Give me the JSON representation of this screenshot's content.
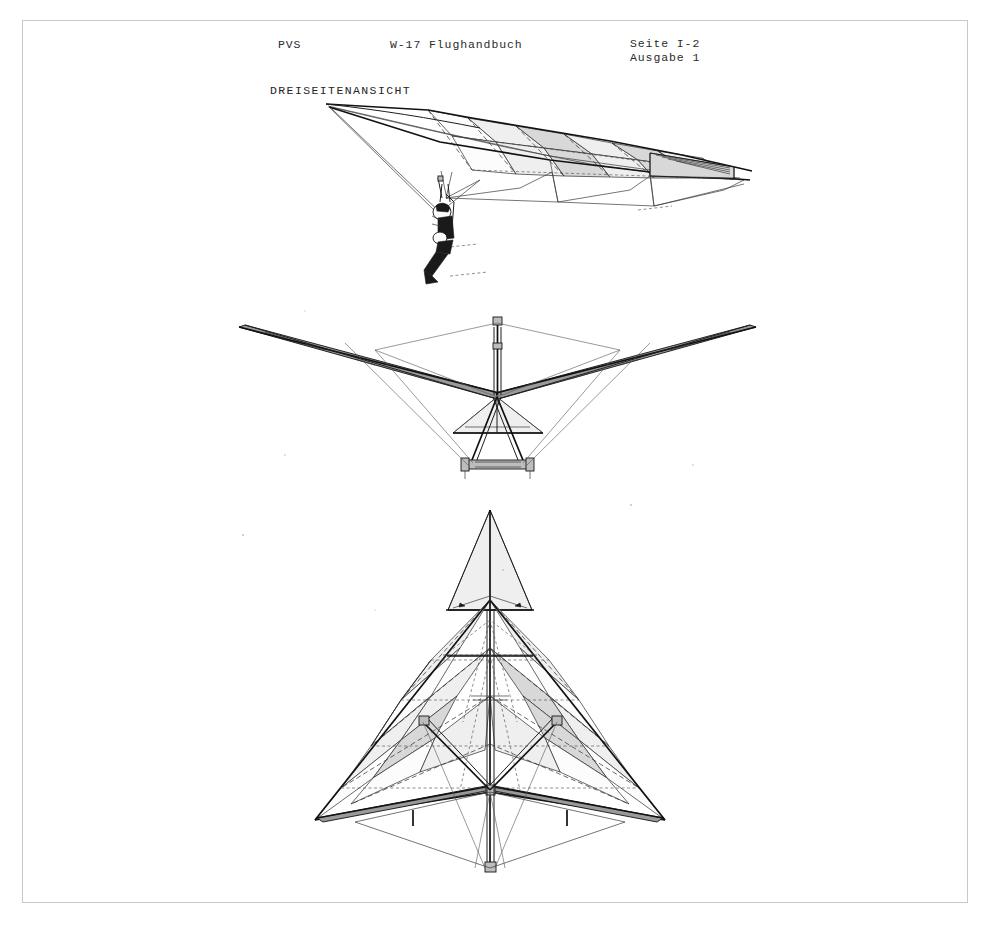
{
  "document": {
    "publisher": "PVS",
    "manual_title": "W-17 Flughandbuch",
    "page_label": "Seite I-2",
    "edition_label": "Ausgabe 1",
    "section_heading": "DREISEITENANSICHT"
  },
  "frame": {
    "name": "scan-border"
  },
  "figures": [
    {
      "id": "perspective",
      "name": "hang-glider-perspective-view",
      "description": "Perspektivische Ansicht des Haengegleiters mit Pilot im Gurtzeug"
    },
    {
      "id": "front",
      "name": "hang-glider-front-view",
      "description": "Vorderansicht mit Kingpost, Steuerbuegel und Fahrwerk"
    },
    {
      "id": "plan",
      "name": "hang-glider-plan-view",
      "description": "Draufsicht des Deltafluegels mit Segelfeldern und Leitwerk"
    }
  ],
  "colors": {
    "ink": "#1e1e1e",
    "frame": "#c9c9c9",
    "sail_light": "#efefef",
    "sail_dark": "#d8d8d8",
    "paper": "#ffffff"
  }
}
